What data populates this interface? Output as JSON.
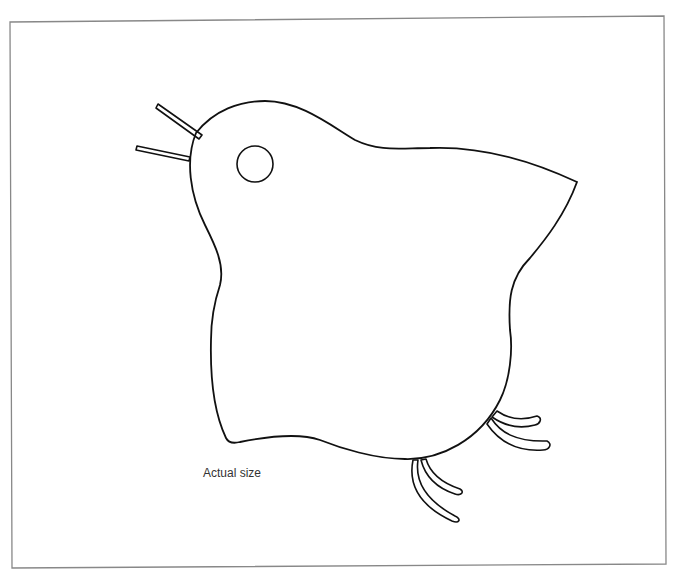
{
  "figure": {
    "caption": "Actual size",
    "line_color": "#111111",
    "frame_color": "#888888",
    "background": "#ffffff"
  }
}
